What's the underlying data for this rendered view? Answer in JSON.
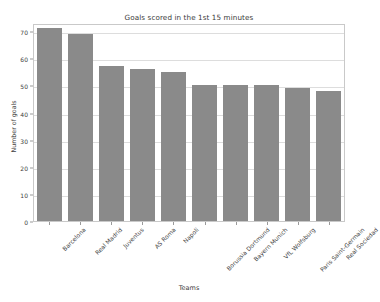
{
  "chart_data": {
    "type": "bar",
    "title": "Goals scored in the 1st 15 minutes",
    "xlabel": "Teams",
    "ylabel": "Number of goals",
    "categories": [
      "Barcelona",
      "Real Madrid",
      "Juventus",
      "AS Roma",
      "Napoli",
      "Borussia Dortmund",
      "Bayern Munich",
      "VfL Wolfsburg",
      "Paris Saint-Germain",
      "Real Sociedad"
    ],
    "values": [
      71,
      69,
      57,
      56,
      55,
      50,
      50,
      50,
      49,
      48
    ],
    "ylim": [
      0,
      73
    ],
    "yticks": [
      0,
      10,
      20,
      30,
      40,
      50,
      60,
      70
    ],
    "ytick_labels": [
      "0",
      "10",
      "20",
      "30",
      "40",
      "50",
      "60",
      "70"
    ],
    "grid": true,
    "grid_axis": "y",
    "legend": false,
    "bar_color": "#8a8a8a",
    "grid_color": "#dddddd",
    "axes_color": "#c9c9c9",
    "background": "#ffffff"
  }
}
